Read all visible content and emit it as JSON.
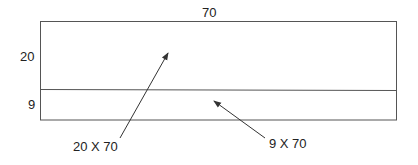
{
  "diagram": {
    "type": "area-decomposition",
    "outer_rect": {
      "width_label": "70"
    },
    "sections": [
      {
        "name": "top",
        "height_label": "20",
        "area_label": "20 X 70"
      },
      {
        "name": "bottom",
        "height_label": "9",
        "area_label": "9 X 70"
      }
    ],
    "colors": {
      "line": "#555555",
      "text": "#222222",
      "background": "#ffffff"
    }
  }
}
